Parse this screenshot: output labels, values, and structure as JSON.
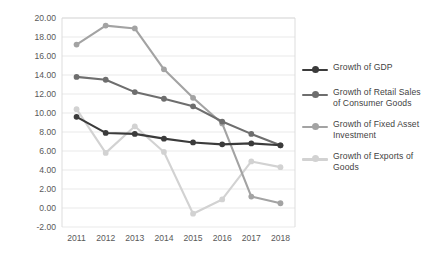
{
  "chart_data": {
    "type": "line",
    "title": "",
    "subtitle": "",
    "xlabel": "",
    "ylabel": "",
    "categories": [
      "2011",
      "2012",
      "2013",
      "2014",
      "2015",
      "2016",
      "2017",
      "2018"
    ],
    "x": [
      2011,
      2012,
      2013,
      2014,
      2015,
      2016,
      2017,
      2018
    ],
    "ylim": [
      -2.0,
      20.0
    ],
    "ytick_step": 2.0,
    "ytick_labels": [
      "20.00",
      "18.00",
      "16.00",
      "14.00",
      "12.00",
      "10.00",
      "8.00",
      "6.00",
      "4.00",
      "2.00",
      "0.00",
      "-2.00"
    ],
    "ytick_values": [
      20,
      18,
      16,
      14,
      12,
      10,
      8,
      6,
      4,
      2,
      0,
      -2
    ],
    "grid": "horizontal",
    "legend_position": "right",
    "markers": "circle",
    "series": [
      {
        "name": "Growth of GDP",
        "color": "#3b3b3b",
        "values": [
          9.6,
          7.9,
          7.8,
          7.3,
          6.9,
          6.7,
          6.8,
          6.6
        ]
      },
      {
        "name": "Growth of Retail Sales of Consumer Goods",
        "color": "#6e6e6e",
        "values": [
          13.8,
          13.5,
          12.2,
          11.5,
          10.7,
          9.1,
          7.8,
          6.6
        ]
      },
      {
        "name": "Growth of Fixed Asset Investment",
        "color": "#a3a3a3",
        "values": [
          17.2,
          19.2,
          18.9,
          14.6,
          11.6,
          8.9,
          1.2,
          0.5
        ]
      },
      {
        "name": "Growth of Exports of Goods",
        "color": "#d2d2d2",
        "values": [
          10.4,
          5.8,
          8.6,
          5.9,
          -0.6,
          0.9,
          4.9,
          4.3
        ]
      }
    ]
  },
  "legend": {
    "items": [
      {
        "label": "Growth of GDP"
      },
      {
        "label": "Growth of Retail Sales of Consumer Goods"
      },
      {
        "label": "Growth of Fixed Asset Investment"
      },
      {
        "label": "Growth of Exports of Goods"
      }
    ]
  },
  "colors": {
    "gdp": "#3b3b3b",
    "retail": "#6e6e6e",
    "fixed_asset": "#a3a3a3",
    "exports": "#d2d2d2",
    "grid": "#e6e6e6",
    "axis_text": "#595959",
    "plot_border": "#d9d9d9",
    "background": "#ffffff"
  }
}
